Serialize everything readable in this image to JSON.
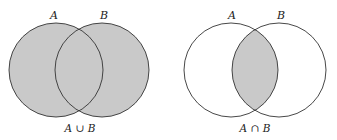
{
  "diagrams": [
    {
      "name": "union",
      "set_a_label": "A",
      "set_b_label": "B",
      "caption": "A ∪ B",
      "shaded_region": "union",
      "fill_color": "#c9c9c9",
      "stroke_color": "#333333"
    },
    {
      "name": "intersection",
      "set_a_label": "A",
      "set_b_label": "B",
      "caption": "A ∩ B",
      "shaded_region": "intersection",
      "fill_color": "#c9c9c9",
      "stroke_color": "#333333"
    }
  ]
}
